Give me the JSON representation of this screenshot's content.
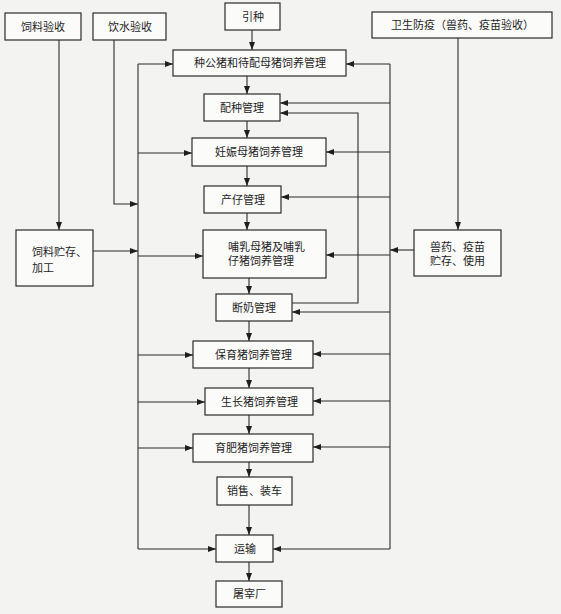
{
  "diagram": {
    "type": "flowchart",
    "colors": {
      "background": "#f3f3f1",
      "box_fill": "#fbfbfa",
      "stroke": "#2b2b2b",
      "text": "#1e1e1e"
    },
    "nodes": {
      "feed_acceptance": {
        "label": "饲料验收"
      },
      "water_acceptance": {
        "label": "饮水验收"
      },
      "introduction": {
        "label": "引种"
      },
      "hygiene": {
        "label": "卫生防疫（兽药、疫苗验收）"
      },
      "boar_sow": {
        "label": "种公猪和待配母猪饲养管理"
      },
      "breeding": {
        "label": "配种管理"
      },
      "pregnant": {
        "label": "妊娠母猪饲养管理"
      },
      "farrowing": {
        "label": "产仔管理"
      },
      "lactation": {
        "lines": [
          "哺乳母猪及哺乳",
          "仔猪饲养管理"
        ]
      },
      "weaning": {
        "label": "断奶管理"
      },
      "nursery": {
        "label": "保育猪饲养管理"
      },
      "growing": {
        "label": "生长猪饲养管理"
      },
      "finishing": {
        "label": "育肥猪饲养管理"
      },
      "sales": {
        "label": "销售、装车"
      },
      "transport": {
        "label": "运输"
      },
      "slaughter": {
        "label": "屠宰厂"
      },
      "feed_storage": {
        "lines": [
          "饲料贮存、",
          "加工"
        ]
      },
      "vet_storage": {
        "lines": [
          "兽药、疫苗",
          "贮存、使用"
        ]
      }
    },
    "edges": [
      {
        "from": "introduction",
        "to": "boar_sow"
      },
      {
        "from": "boar_sow",
        "to": "breeding"
      },
      {
        "from": "breeding",
        "to": "pregnant"
      },
      {
        "from": "pregnant",
        "to": "farrowing"
      },
      {
        "from": "farrowing",
        "to": "lactation"
      },
      {
        "from": "lactation",
        "to": "weaning"
      },
      {
        "from": "weaning",
        "to": "nursery"
      },
      {
        "from": "nursery",
        "to": "growing"
      },
      {
        "from": "growing",
        "to": "finishing"
      },
      {
        "from": "finishing",
        "to": "sales"
      },
      {
        "from": "sales",
        "to": "transport"
      },
      {
        "from": "transport",
        "to": "slaughter"
      },
      {
        "from": "weaning",
        "to": "breeding"
      },
      {
        "from": "feed_acceptance",
        "to": "feed_storage"
      },
      {
        "from": "feed_storage",
        "to": [
          "boar_sow",
          "pregnant",
          "lactation",
          "nursery",
          "growing",
          "finishing",
          "transport"
        ]
      },
      {
        "from": "water_acceptance",
        "to": [
          "boar_sow",
          "pregnant",
          "lactation",
          "nursery",
          "growing",
          "finishing",
          "transport"
        ]
      },
      {
        "from": "hygiene",
        "to": "vet_storage"
      },
      {
        "from": "vet_storage",
        "to": [
          "boar_sow",
          "breeding",
          "pregnant",
          "farrowing",
          "lactation",
          "weaning",
          "nursery",
          "growing",
          "finishing",
          "transport"
        ]
      }
    ]
  }
}
